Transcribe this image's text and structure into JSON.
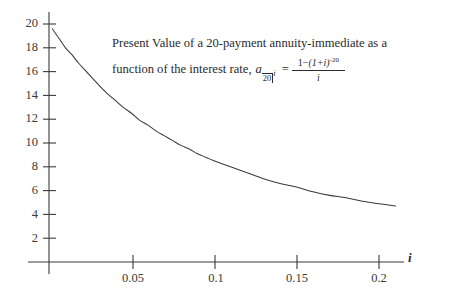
{
  "chart_data": {
    "type": "line",
    "title": "Present Value of a 20-payment annuity-immediate as a function of the interest rate",
    "annotation": {
      "line1": "Present Value of a 20-payment annuity-immediate as a",
      "line2_prefix": "function of the interest rate,",
      "formula_symbol_a": "a",
      "formula_symbol_sub_n": "20",
      "formula_symbol_sub_i": "i",
      "formula_equals": "=",
      "formula_numerator_pre": "1",
      "formula_numerator_minus": "−",
      "formula_numerator_base": "(1+i)",
      "formula_numerator_exp": "-20",
      "formula_denominator": "i"
    },
    "xlabel": "i",
    "ylabel": "",
    "xlim": [
      0,
      0.235
    ],
    "ylim": [
      0,
      21.2
    ],
    "grid": false,
    "legend": false,
    "xticks": [
      0.05,
      0.1,
      0.15,
      0.2
    ],
    "xticklabels": [
      "0.05",
      "0.1",
      "0.15",
      "0.2"
    ],
    "yticks": [
      2,
      4,
      6,
      8,
      10,
      12,
      14,
      16,
      18,
      20
    ],
    "yticklabels": [
      "2",
      "4",
      "6",
      "8",
      "10",
      "12",
      "14",
      "16",
      "18",
      "20"
    ],
    "series": [
      {
        "name": "a(20|i)",
        "color": "#3a3a3a",
        "x": [
          0.002,
          0.006,
          0.01,
          0.014,
          0.018,
          0.022,
          0.026,
          0.03,
          0.035,
          0.04,
          0.045,
          0.05,
          0.055,
          0.06,
          0.065,
          0.07,
          0.075,
          0.08,
          0.085,
          0.09,
          0.095,
          0.1,
          0.11,
          0.12,
          0.13,
          0.14,
          0.15,
          0.16,
          0.17,
          0.18,
          0.19,
          0.2,
          0.21
        ],
        "y": [
          19.6,
          18.8,
          18.0,
          17.4,
          16.7,
          16.1,
          15.5,
          14.9,
          14.2,
          13.6,
          13.0,
          12.5,
          11.9,
          11.5,
          11.0,
          10.6,
          10.2,
          9.8,
          9.5,
          9.1,
          8.8,
          8.5,
          8.0,
          7.5,
          7.0,
          6.6,
          6.3,
          5.9,
          5.6,
          5.4,
          5.1,
          4.9,
          4.7
        ]
      }
    ],
    "axis_color": "#3a3a3a"
  }
}
